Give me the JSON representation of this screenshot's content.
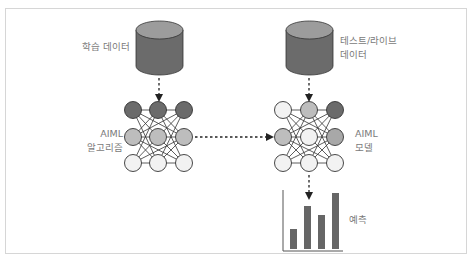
{
  "diagram": {
    "training_data": {
      "label": "학습 데이터",
      "icon": "database-icon"
    },
    "test_data": {
      "label_line1": "테스트/라이브",
      "label_line2": "데이터",
      "icon": "database-icon"
    },
    "algorithm": {
      "label_line1": "AIML",
      "label_line2": "알고리즘",
      "icon": "neural-network-icon"
    },
    "model": {
      "label_line1": "AIML",
      "label_line2": "모델",
      "icon": "neural-network-icon"
    },
    "prediction": {
      "label": "예측",
      "icon": "bar-chart-icon"
    },
    "colors": {
      "db_top": "#9c9c9c",
      "db_body": "#6b6b6b",
      "node_dark": "#6b6b6b",
      "node_mid": "#bdbdbd",
      "node_light": "#f2f2f2",
      "bar": "#666666",
      "line": "#333333",
      "label": "#7a7a7a"
    },
    "prediction_bars": [
      0.28,
      0.72,
      0.55,
      0.92
    ]
  }
}
